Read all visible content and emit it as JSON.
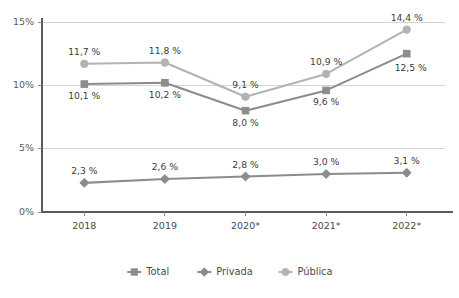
{
  "chart_data": {
    "type": "line",
    "title": "",
    "subtitle": "",
    "xlabel": "",
    "ylabel": "",
    "categories": [
      "2018",
      "2019",
      "2020*",
      "2021*",
      "2022*"
    ],
    "ylim": [
      0,
      15
    ],
    "yticks": [
      0,
      5,
      10,
      15
    ],
    "ytick_labels": [
      "0%",
      "5%",
      "10%",
      "15%"
    ],
    "grid": true,
    "legend_position": "bottom",
    "series": [
      {
        "name": "Total",
        "color": "#8c8c8c",
        "marker": "square",
        "values": [
          10.1,
          10.2,
          8.0,
          9.6,
          12.5
        ],
        "labels": [
          "10,1 %",
          "10,2 %",
          "8,0 %",
          "9,6 %",
          "12,5 %"
        ],
        "label_positions": [
          "below",
          "below",
          "below",
          "below",
          "below-right"
        ]
      },
      {
        "name": "Privada",
        "color": "#8c8c8c",
        "marker": "diamond",
        "values": [
          2.3,
          2.6,
          2.8,
          3.0,
          3.1
        ],
        "labels": [
          "2,3 %",
          "2,6 %",
          "2,8 %",
          "3,0 %",
          "3,1 %"
        ],
        "label_positions": [
          "above",
          "above",
          "above",
          "above",
          "above"
        ]
      },
      {
        "name": "Pública",
        "color": "#b3b3b3",
        "marker": "circle",
        "values": [
          11.7,
          11.8,
          9.1,
          10.9,
          14.4
        ],
        "labels": [
          "11,7 %",
          "11,8 %",
          "9,1 %",
          "10,9 %",
          "14,4 %"
        ],
        "label_positions": [
          "above",
          "above",
          "above",
          "above",
          "above"
        ]
      }
    ]
  },
  "legend": {
    "items": [
      {
        "label": "Total",
        "color": "#8c8c8c",
        "marker": "square"
      },
      {
        "label": "Privada",
        "color": "#8c8c8c",
        "marker": "diamond"
      },
      {
        "label": "Pública",
        "color": "#b3b3b3",
        "marker": "circle"
      }
    ]
  },
  "axes": {
    "y_labels": [
      "15%",
      "10%",
      "5%",
      "0%"
    ],
    "x_labels": [
      "2018",
      "2019",
      "2020*",
      "2021*",
      "2022*"
    ]
  },
  "colors": {
    "gridline": "#d4d4d4",
    "axis": "#595959",
    "series_dark": "#8c8c8c",
    "series_light": "#b3b3b3",
    "text": "#4a4a4a",
    "background": "#ffffff"
  }
}
